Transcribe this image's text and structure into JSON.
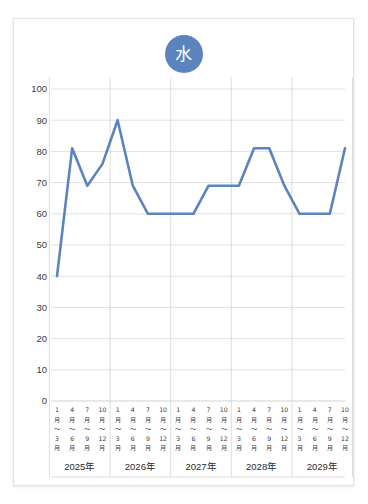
{
  "card": {
    "title_badge_text": "水",
    "badge_color": "#5b84be"
  },
  "chart_data": {
    "type": "line",
    "title": "水",
    "xlabel": "",
    "ylabel": "",
    "ylim": [
      0,
      100
    ],
    "ytick_step": 10,
    "grid": true,
    "legend": "none",
    "line_color": "#5b84be",
    "yticks": [
      "0",
      "10",
      "20",
      "30",
      "40",
      "50",
      "60",
      "70",
      "80",
      "90",
      "100"
    ],
    "group_labels": [
      "2025年",
      "2026年",
      "2027年",
      "2028年",
      "2029年"
    ],
    "quarter_labels": [
      "1月～3月",
      "4月～6月",
      "7月～9月",
      "10月～12月"
    ],
    "quarter_label_lines": [
      [
        "1",
        "月",
        "～",
        "3",
        "月"
      ],
      [
        "4",
        "月",
        "～",
        "6",
        "月"
      ],
      [
        "7",
        "月",
        "～",
        "9",
        "月"
      ],
      [
        "10",
        "月",
        "～",
        "12",
        "月"
      ]
    ],
    "categories": [
      "2025年 1月～3月",
      "2025年 4月～6月",
      "2025年 7月～9月",
      "2025年 10月～12月",
      "2026年 1月～3月",
      "2026年 4月～6月",
      "2026年 7月～9月",
      "2026年 10月～12月",
      "2027年 1月～3月",
      "2027年 4月～6月",
      "2027年 7月～9月",
      "2027年 10月～12月",
      "2028年 1月～3月",
      "2028年 4月～6月",
      "2028年 7月～9月",
      "2028年 10月～12月",
      "2029年 1月～3月",
      "2029年 4月～6月",
      "2029年 7月～9月",
      "2029年 10月～12月"
    ],
    "values": [
      40,
      81,
      69,
      76,
      90,
      69,
      60,
      60,
      60,
      60,
      69,
      69,
      69,
      81,
      81,
      69,
      60,
      60,
      60,
      81
    ],
    "series": [
      {
        "name": "水",
        "values": [
          40,
          81,
          69,
          76,
          90,
          69,
          60,
          60,
          60,
          60,
          69,
          69,
          69,
          81,
          81,
          69,
          60,
          60,
          60,
          81
        ]
      }
    ]
  }
}
